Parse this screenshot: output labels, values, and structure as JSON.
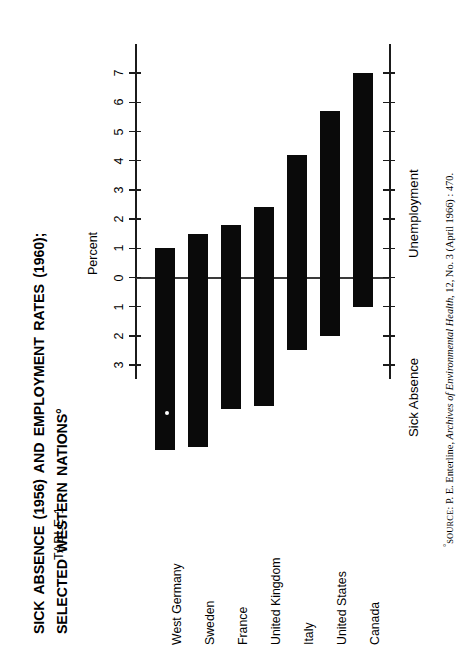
{
  "table_number": "TABLE 1",
  "title_line_1": "SICK ABSENCE (1956) AND EMPLOYMENT RATES (1960);",
  "title_line_2": "SELECTED WESTERN NATIONS°",
  "axis": {
    "unit_label": "Percent",
    "upper_section_label": "Unemployment",
    "lower_section_label": "Sick Absence",
    "tick_labels": [
      "7",
      "6",
      "5",
      "4",
      "3",
      "2",
      "1",
      "0",
      "1",
      "2",
      "3",
      "4",
      "5",
      "6"
    ]
  },
  "source_note": {
    "marker": "°",
    "prefix": "SOURCE",
    "text_before_italic": ": P. E. Enterline, ",
    "italic": "Archives of Environmental Health",
    "text_after_italic": ", 12, No. 3 (April 1966) : 470."
  },
  "chart_data": {
    "type": "bar",
    "title": "SICK ABSENCE (1956) AND EMPLOYMENT RATES (1960); SELECTED WESTERN NATIONS",
    "xlabel": "",
    "ylabel": "Percent",
    "ylim": [
      -6.5,
      7.5
    ],
    "grid": false,
    "legend_position": "none",
    "orientation": "vertical",
    "categories": [
      "West Germany",
      "Sweden",
      "France",
      "United Kingdom",
      "Italy",
      "United States",
      "Canada"
    ],
    "series": [
      {
        "name": "Unemployment",
        "units": "percent",
        "values": [
          1.0,
          1.5,
          1.8,
          2.4,
          4.2,
          5.7,
          7.0
        ]
      },
      {
        "name": "Sick Absence",
        "units": "percent",
        "values": [
          5.9,
          5.8,
          4.5,
          4.4,
          2.5,
          2.0,
          1.0
        ]
      }
    ]
  }
}
